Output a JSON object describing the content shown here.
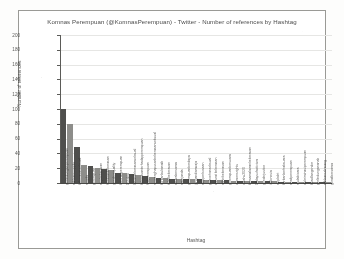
{
  "chart_data": {
    "type": "bar",
    "title": "Komnas Perempuan (@KomnasPerempuan) - Twitter - Number of references by Hashtag",
    "xlabel": "Hashtag",
    "ylabel": "Number of references",
    "ylim": [
      0,
      200
    ],
    "yticks": [
      0,
      20,
      40,
      60,
      80,
      100,
      120,
      140,
      160,
      180,
      200
    ],
    "grid": true,
    "legend": false,
    "categories": [
      "perlindunganperempuan",
      "sahkanruuppks",
      "kekerasanseksual",
      "ruupks",
      "perempuan",
      "stopkekerasan",
      "hentikankekerasan",
      "genderequality",
      "komnasperempuan",
      "16haktp",
      "lawankekerasanseksual",
      "kekerasanterhadapperempuan",
      "hakperempuan",
      "ruupenghapusankekerasanseksual",
      "korbanbukanaib",
      "tolakkekerasan",
      "setarabersama",
      "savejanda",
      "perempuanberdaya",
      "jangandiamsaja",
      "stopperkosaan",
      "pelecehanseksual",
      "darurat kekerasan",
      "akhirikekerasan",
      "perempuanbersuara",
      "womensrights",
      "catahu2020",
      "bersamalawankekerasan",
      "16daysofactivism",
      "genderjustice",
      "indonesia",
      "stopkdrt",
      "korbanberhaksuara",
      "anakperempuan",
      "mulaibicara",
      "diskriminasiperempuan",
      "keadilangender",
      "perlindungananak",
      "sahkansekarang",
      "gerakbersama"
    ],
    "values": [
      100,
      80,
      48,
      25,
      23,
      20,
      19,
      17,
      14,
      13,
      12,
      11,
      10,
      8,
      7,
      7,
      6,
      6,
      5,
      5,
      5,
      4,
      4,
      4,
      4,
      3,
      3,
      3,
      3,
      3,
      3,
      3,
      2,
      2,
      2,
      2,
      2,
      2,
      2,
      2
    ],
    "bar_colors": [
      "#4f4f4d",
      "#8d8d8a"
    ]
  }
}
